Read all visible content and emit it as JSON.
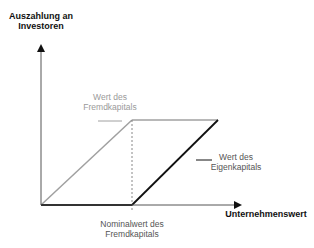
{
  "diagram": {
    "y_axis_label_line1": "Auszahlung an",
    "y_axis_label_line2": "Investoren",
    "x_axis_label": "Unternehmenswert",
    "debt_label_line1": "Wert des",
    "debt_label_line2": "Fremdkapitals",
    "equity_label_line1": "Wert des",
    "equity_label_line2": "Eigenkapitals",
    "face_value_label_line1": "Nominalwert des",
    "face_value_label_line2": "Fremdkapitals",
    "colors": {
      "axis": "#111111",
      "debt_line": "#999999",
      "equity_line": "#111111",
      "dashed_line": "#888888"
    }
  }
}
